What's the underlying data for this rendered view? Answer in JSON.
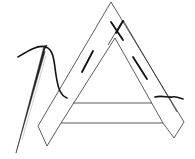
{
  "figure": {
    "description": "Sewing illustration: needle and thread stitching an A-shaped frame made of folded fabric strips",
    "elements": [
      "needle",
      "thread",
      "a-frame",
      "running-stitches",
      "crossbar"
    ]
  },
  "colors": {
    "background": "#ffffff",
    "outline": "#333333",
    "thread": "#111111",
    "needle": "#222222"
  }
}
